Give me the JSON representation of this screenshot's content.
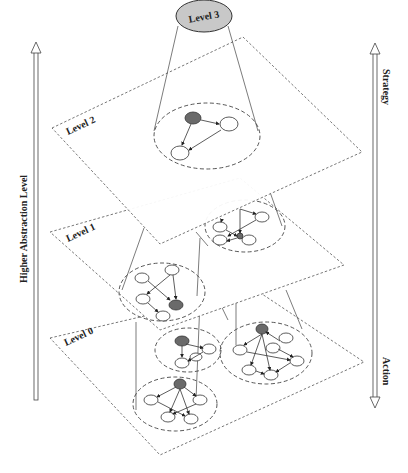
{
  "figure": {
    "left_axis": {
      "label": "Higher Abstraction Level",
      "direction": "up"
    },
    "right_axis": {
      "top_label": "Strategy",
      "bottom_label": "Action",
      "direction": "both"
    },
    "top_node": {
      "label": "Level 3",
      "fill": "#c8c8c8"
    },
    "levels": [
      {
        "label": "Level 2",
        "groups": 1
      },
      {
        "label": "Level 1",
        "groups": 2
      },
      {
        "label": "Level 0",
        "groups": 3
      }
    ],
    "colors": {
      "active_node": "#6a6a6a",
      "node": "#ffffff",
      "stroke": "#333333"
    }
  }
}
